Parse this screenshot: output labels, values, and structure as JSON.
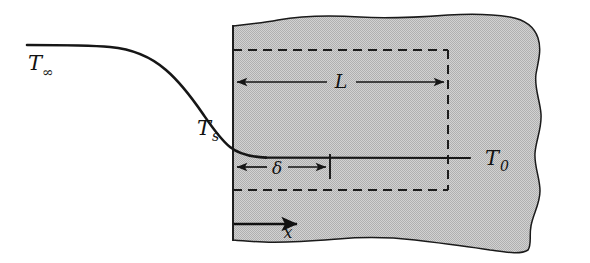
{
  "figure": {
    "kind": "thermal-boundary-layer-diagram",
    "background_color": "#ffffff",
    "body_fill_color": "#c3c3c3",
    "line_color": "#161616"
  },
  "labels": {
    "t_infinity": {
      "base": "T",
      "sub": "∞",
      "x": 28,
      "y": 70
    },
    "t_surface": {
      "base": "T",
      "sub": "s",
      "x": 197,
      "y": 135
    },
    "t_zero": {
      "base": "T",
      "sub": "0",
      "x": 485,
      "y": 165
    },
    "length_L": {
      "text": "L",
      "x": 341,
      "y": 88
    },
    "delta": {
      "text": "δ",
      "x": 277,
      "y": 174
    },
    "x_axis": {
      "text": "x",
      "x": 288,
      "y": 236
    }
  },
  "dimensions": {
    "L": {
      "name": "L",
      "meaning": "body length along x",
      "start_x": 233,
      "end_x": 448,
      "y": 82
    },
    "delta": {
      "name": "δ",
      "meaning": "thermal boundary layer thickness",
      "start_x": 233,
      "end_x": 330,
      "y": 167
    }
  },
  "axes": {
    "x_arrow": {
      "start_x": 234,
      "end_x": 300,
      "y": 224,
      "direction": "right"
    }
  },
  "dashed_rectangle": {
    "left": 233,
    "right": 448,
    "top": 50,
    "bottom": 190
  },
  "curve": {
    "description": "Temperature profile: flat at T-infinity on the left, steep drop through T-s at the body surface, asymptotic to T-0 inside the body.",
    "free_stream_y": 45,
    "asymptote_y": 157,
    "start_x": 27,
    "end_x": 470
  }
}
